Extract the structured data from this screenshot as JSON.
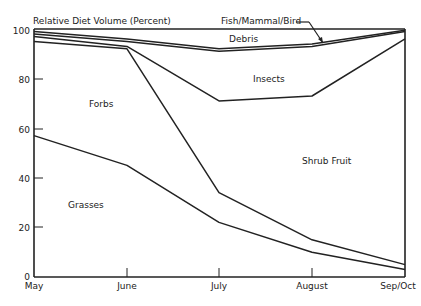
{
  "chart_data": {
    "type": "area",
    "stacked": true,
    "title": "",
    "ylabel": "Relative Diet Volume (Percent)",
    "xlabel": "",
    "categories": [
      "May",
      "June",
      "July",
      "August",
      "Sep/Oct"
    ],
    "ylim": [
      0,
      100
    ],
    "yticks": [
      0,
      20,
      40,
      60,
      80,
      100
    ],
    "grid": false,
    "legend": "inline labels",
    "series": [
      {
        "name": "Grasses",
        "values": [
          57,
          45,
          22,
          10,
          3
        ]
      },
      {
        "name": "Forbs",
        "values": [
          38,
          47,
          12,
          5,
          2
        ]
      },
      {
        "name": "Shrub Fruit",
        "values": [
          2,
          1,
          37,
          58,
          91
        ]
      },
      {
        "name": "Insects",
        "values": [
          1,
          2,
          20,
          20,
          3
        ]
      },
      {
        "name": "Debris",
        "values": [
          1,
          1,
          1,
          1,
          0.5
        ]
      },
      {
        "name": "Fish/Mammal/Bird",
        "values": [
          1,
          4,
          8,
          6,
          0.5
        ]
      }
    ],
    "cumulative_boundaries": [
      [
        57,
        45,
        22,
        10,
        3
      ],
      [
        95,
        92,
        34,
        15,
        5
      ],
      [
        97,
        93,
        71,
        73,
        96
      ],
      [
        98,
        95,
        91,
        93,
        99
      ],
      [
        99,
        96,
        92,
        94,
        99.5
      ],
      [
        100,
        100,
        100,
        100,
        100
      ]
    ],
    "annotations": [
      {
        "text": "Fish/Mammal/Bird",
        "arrow": true
      }
    ]
  },
  "labels": {
    "ylabel": "Relative Diet Volume (Percent)",
    "yticks": [
      "0",
      "20",
      "40",
      "60",
      "80",
      "100"
    ],
    "xticks": [
      "May",
      "June",
      "July",
      "August",
      "Sep/Oct"
    ],
    "areas": {
      "grasses": "Grasses",
      "forbs": "Forbs",
      "shrub_fruit": "Shrub Fruit",
      "insects": "Insects",
      "debris": "Debris",
      "fish": "Fish/Mammal/Bird"
    }
  }
}
